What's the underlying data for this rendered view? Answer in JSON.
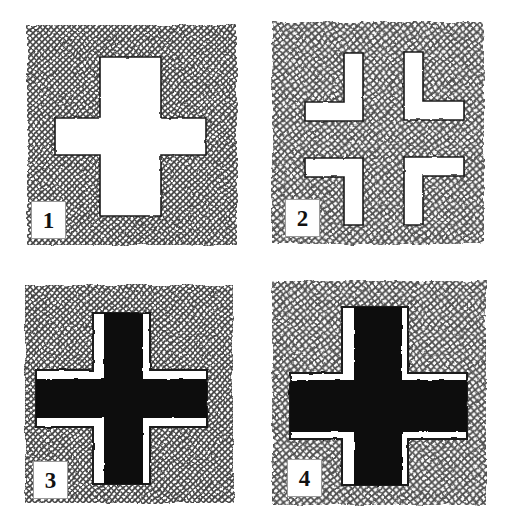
{
  "figure": {
    "background_color": "#ffffff",
    "hatch_color": "#5a5a5a",
    "ink_color": "#111111",
    "paper_color": "#ffffff",
    "panel_count": 4
  },
  "panels": [
    {
      "number": "1",
      "label": "1",
      "description": "Plain white Greek cross cut out of a cross-hatched square",
      "square": {
        "x": 27,
        "y": 25,
        "width": 210,
        "height": 220
      },
      "cross": {
        "type": "greek-cross",
        "fill": "#ffffff",
        "stroke": "#111111",
        "center_x": 131,
        "center_y": 136,
        "arm_span_horizontal": 150,
        "arm_span_vertical": 158,
        "arm_width": 31
      },
      "pieces": 1
    },
    {
      "number": "2",
      "label": "2",
      "description": "The cross dissected into four congruent L-shaped pieces in pinwheel arrangement",
      "square": {
        "x": 11,
        "y": 22,
        "width": 212,
        "height": 222
      },
      "pieces": 4,
      "piece_shape": "L-shape",
      "piece_fill": "#ffffff",
      "piece_stroke": "#111111",
      "piece_arm_width": 19,
      "arrangement": "pinwheel",
      "piece_rotations": [
        0,
        90,
        180,
        270
      ]
    },
    {
      "number": "3",
      "label": "3",
      "description": "Black cross inset within a larger white cross on hatched square; narrow black cross",
      "square": {
        "x": 25,
        "y": 22,
        "width": 208,
        "height": 218
      },
      "white_cross": {
        "fill": "#ffffff",
        "stroke": "#111111",
        "arm_span_horizontal": 157,
        "arm_span_vertical": 163,
        "arm_width": 57
      },
      "black_cross": {
        "fill": "#111111",
        "arm_span_horizontal": 157,
        "arm_span_vertical": 163,
        "arm_width": 39,
        "offset_x": 4,
        "offset_y": 0
      }
    },
    {
      "number": "4",
      "label": "4",
      "description": "Black cross inset within a white cross on hatched square; wide black cross leaving thin white margins",
      "square": {
        "x": 11,
        "y": 18,
        "width": 214,
        "height": 224
      },
      "white_cross": {
        "fill": "#ffffff",
        "stroke": "#111111",
        "arm_span_horizontal": 165,
        "arm_span_vertical": 172,
        "arm_width": 66
      },
      "black_cross": {
        "fill": "#111111",
        "arm_span_horizontal": 165,
        "arm_span_vertical": 172,
        "arm_width": 52,
        "offset_x": 2,
        "offset_y": 0
      }
    }
  ]
}
